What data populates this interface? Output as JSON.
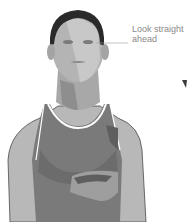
{
  "illustration": {
    "subject": "woman in tank top, head facing forward",
    "annotation": {
      "line1": "Look straight",
      "line2": "ahead"
    },
    "colors": {
      "skin_light": "#c4c4c4",
      "skin_mid": "#9e9e9e",
      "top": "#7a7a7a",
      "top_dark": "#5e5e5e",
      "hair": "#2a2a2a",
      "outline": "#4a4a4a",
      "leader_line": "#9a9a9a"
    }
  }
}
